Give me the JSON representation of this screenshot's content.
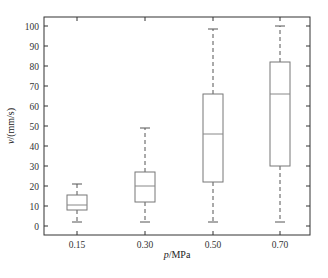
{
  "chart_data": {
    "type": "boxplot",
    "title": "",
    "xlabel": "p/MPa",
    "ylabel": "v/(mm/s)",
    "xlabel_parts": {
      "var": "p",
      "unit": "/MPa"
    },
    "ylabel_parts": {
      "var": "v",
      "unit": "/(mm/s)"
    },
    "categories": [
      "0.15",
      "0.30",
      "0.50",
      "0.70"
    ],
    "ylim": [
      -3,
      105
    ],
    "yticks": [
      0,
      10,
      20,
      30,
      40,
      50,
      60,
      70,
      80,
      90,
      100
    ],
    "grid": false,
    "legend": null,
    "boxes": [
      {
        "category": "0.15",
        "min": 2,
        "q1": 8,
        "median": 10.5,
        "q3": 15.5,
        "max": 21
      },
      {
        "category": "0.30",
        "min": 2,
        "q1": 12,
        "median": 20,
        "q3": 27,
        "max": 49
      },
      {
        "category": "0.50",
        "min": 2,
        "q1": 22,
        "median": 46,
        "q3": 66,
        "max": 98.5
      },
      {
        "category": "0.70",
        "min": 2,
        "q1": 30,
        "median": 66,
        "q3": 82,
        "max": 100
      }
    ]
  },
  "style": {
    "axis_color": "#333333",
    "box_color": "#777777",
    "median_color": "#888888",
    "whisker_color": "#555555"
  }
}
